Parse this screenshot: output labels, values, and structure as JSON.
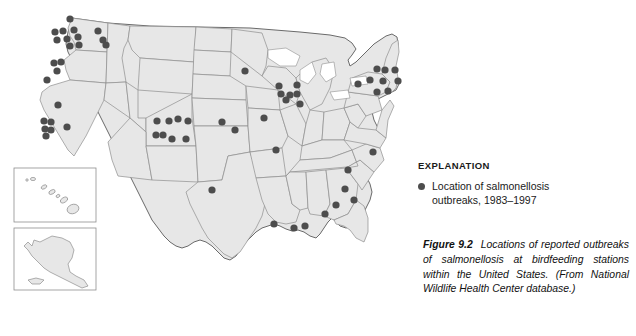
{
  "figure": {
    "legend": {
      "title": "EXPLANATION",
      "marker_icon": "filled-circle-icon",
      "entry_line1": "Location of salmonellosis",
      "entry_line2": "outbreaks, 1983–1997"
    },
    "caption": {
      "label": "Figure 9.2",
      "text": "Locations of reported outbreaks of salmonellosis at birdfeeding stations within the United States. (From National Wildlife Health Center database.)"
    }
  },
  "colors": {
    "dot": "#4d4d4d",
    "land_fill": "#e7e7e7",
    "state_border": "#8e8e8e",
    "country_border": "#6a6a6a",
    "text": "#111111",
    "background": "#ffffff"
  },
  "chart_data": {
    "type": "scatter",
    "title": "Locations of reported outbreaks of salmonellosis at birdfeeding stations within the United States",
    "xlabel": "",
    "ylabel": "",
    "projection": "united-states-map",
    "legend_position": "right",
    "grid": false,
    "series": [
      {
        "name": "Location of salmonellosis outbreaks, 1983–1997",
        "marker": "filled-circle",
        "color": "#4d4d4d",
        "count": 66,
        "points": [
          {
            "x": 70,
            "y": 19,
            "region": "WA-north"
          },
          {
            "x": 55,
            "y": 32,
            "region": "WA-puget"
          },
          {
            "x": 63,
            "y": 31,
            "region": "WA-puget"
          },
          {
            "x": 74,
            "y": 30,
            "region": "WA-puget"
          },
          {
            "x": 57,
            "y": 40,
            "region": "WA-puget"
          },
          {
            "x": 67,
            "y": 39,
            "region": "WA-puget"
          },
          {
            "x": 78,
            "y": 37,
            "region": "WA-central"
          },
          {
            "x": 70,
            "y": 46,
            "region": "WA-south"
          },
          {
            "x": 79,
            "y": 45,
            "region": "WA-south"
          },
          {
            "x": 98,
            "y": 31,
            "region": "ID-north"
          },
          {
            "x": 103,
            "y": 40,
            "region": "ID-north"
          },
          {
            "x": 106,
            "y": 45,
            "region": "ID-north"
          },
          {
            "x": 54,
            "y": 63,
            "region": "OR-west"
          },
          {
            "x": 61,
            "y": 62,
            "region": "OR-west"
          },
          {
            "x": 57,
            "y": 71,
            "region": "OR-west"
          },
          {
            "x": 47,
            "y": 80,
            "region": "OR-southwest"
          },
          {
            "x": 58,
            "y": 105,
            "region": "CA-north"
          },
          {
            "x": 44,
            "y": 121,
            "region": "CA-north"
          },
          {
            "x": 51,
            "y": 122,
            "region": "CA-north"
          },
          {
            "x": 45,
            "y": 129,
            "region": "CA-north"
          },
          {
            "x": 51,
            "y": 130,
            "region": "CA-north"
          },
          {
            "x": 46,
            "y": 136,
            "region": "CA-central"
          },
          {
            "x": 67,
            "y": 127,
            "region": "CA-sierra"
          },
          {
            "x": 157,
            "y": 121,
            "region": "CO-north"
          },
          {
            "x": 169,
            "y": 121,
            "region": "CO-north"
          },
          {
            "x": 178,
            "y": 119,
            "region": "CO-north"
          },
          {
            "x": 188,
            "y": 121,
            "region": "CO-north"
          },
          {
            "x": 156,
            "y": 135,
            "region": "CO-south"
          },
          {
            "x": 163,
            "y": 135,
            "region": "CO-south"
          },
          {
            "x": 172,
            "y": 139,
            "region": "CO-south"
          },
          {
            "x": 186,
            "y": 139,
            "region": "CO-south"
          },
          {
            "x": 245,
            "y": 71,
            "region": "MN"
          },
          {
            "x": 279,
            "y": 86,
            "region": "WI-north"
          },
          {
            "x": 297,
            "y": 85,
            "region": "WI-north"
          },
          {
            "x": 281,
            "y": 94,
            "region": "WI"
          },
          {
            "x": 290,
            "y": 95,
            "region": "WI"
          },
          {
            "x": 297,
            "y": 94,
            "region": "WI"
          },
          {
            "x": 286,
            "y": 100,
            "region": "IA-north"
          },
          {
            "x": 300,
            "y": 104,
            "region": "IL-north"
          },
          {
            "x": 222,
            "y": 122,
            "region": "NE"
          },
          {
            "x": 264,
            "y": 118,
            "region": "IA"
          },
          {
            "x": 235,
            "y": 130,
            "region": "KS"
          },
          {
            "x": 276,
            "y": 150,
            "region": "IL-south"
          },
          {
            "x": 212,
            "y": 190,
            "region": "OK"
          },
          {
            "x": 377,
            "y": 69,
            "region": "VT-NH"
          },
          {
            "x": 385,
            "y": 70,
            "region": "NH-ME"
          },
          {
            "x": 395,
            "y": 70,
            "region": "ME-south"
          },
          {
            "x": 370,
            "y": 80,
            "region": "NY-adirondack"
          },
          {
            "x": 383,
            "y": 81,
            "region": "NY-east"
          },
          {
            "x": 398,
            "y": 81,
            "region": "MA"
          },
          {
            "x": 377,
            "y": 92,
            "region": "NY-catskill"
          },
          {
            "x": 388,
            "y": 91,
            "region": "CT-RI"
          },
          {
            "x": 358,
            "y": 84,
            "region": "NY-west"
          },
          {
            "x": 373,
            "y": 152,
            "region": "VA"
          },
          {
            "x": 348,
            "y": 170,
            "region": "NC-TN"
          },
          {
            "x": 345,
            "y": 189,
            "region": "GA-north"
          },
          {
            "x": 354,
            "y": 200,
            "region": "SC-GA"
          },
          {
            "x": 336,
            "y": 205,
            "region": "GA-central"
          },
          {
            "x": 325,
            "y": 214,
            "region": "AL-GA"
          },
          {
            "x": 274,
            "y": 224,
            "region": "LA-north"
          },
          {
            "x": 294,
            "y": 228,
            "region": "LA-south"
          },
          {
            "x": 305,
            "y": 226,
            "region": "MS-gulf"
          }
        ]
      }
    ]
  }
}
